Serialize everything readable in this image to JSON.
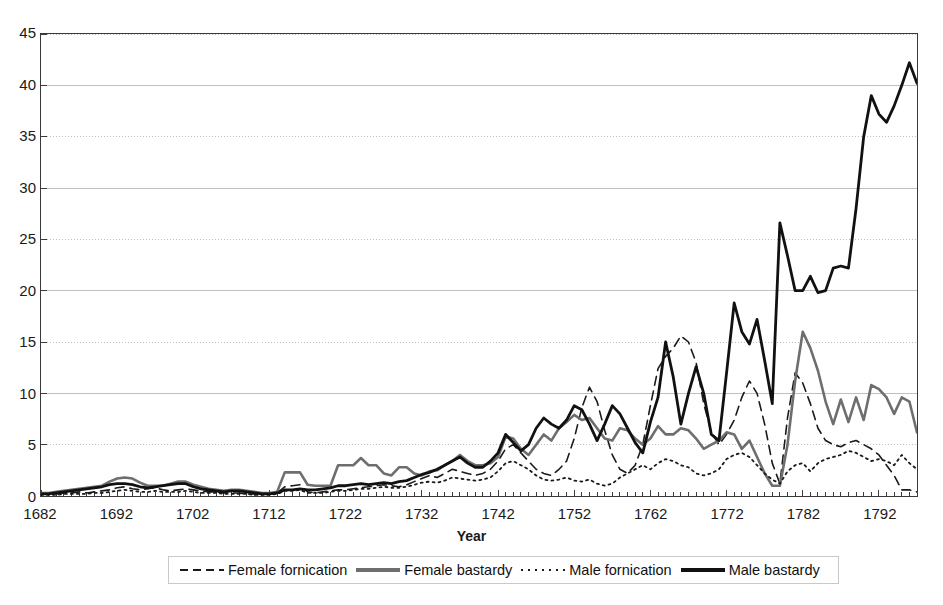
{
  "chart_data": {
    "type": "line",
    "title": "",
    "xlabel": "Year",
    "ylabel": "",
    "xlim": [
      1682,
      1797
    ],
    "ylim": [
      0,
      45
    ],
    "grid": true,
    "legend_position": "bottom",
    "y_ticks": [
      0,
      5,
      10,
      15,
      20,
      25,
      30,
      35,
      40,
      45
    ],
    "x_ticks": [
      1682,
      1692,
      1702,
      1712,
      1722,
      1732,
      1742,
      1752,
      1762,
      1772,
      1782,
      1792
    ],
    "x": [
      1682,
      1683,
      1684,
      1685,
      1686,
      1687,
      1688,
      1689,
      1690,
      1691,
      1692,
      1693,
      1694,
      1695,
      1696,
      1697,
      1698,
      1699,
      1700,
      1701,
      1702,
      1703,
      1704,
      1705,
      1706,
      1707,
      1708,
      1709,
      1710,
      1711,
      1712,
      1713,
      1714,
      1715,
      1716,
      1717,
      1718,
      1719,
      1720,
      1721,
      1722,
      1723,
      1724,
      1725,
      1726,
      1727,
      1728,
      1729,
      1730,
      1731,
      1732,
      1733,
      1734,
      1735,
      1736,
      1737,
      1738,
      1739,
      1740,
      1741,
      1742,
      1743,
      1744,
      1745,
      1746,
      1747,
      1748,
      1749,
      1750,
      1751,
      1752,
      1753,
      1754,
      1755,
      1756,
      1757,
      1758,
      1759,
      1760,
      1761,
      1762,
      1763,
      1764,
      1765,
      1766,
      1767,
      1768,
      1769,
      1770,
      1771,
      1772,
      1773,
      1774,
      1775,
      1776,
      1777,
      1778,
      1779,
      1780,
      1781,
      1782,
      1783,
      1784,
      1785,
      1786,
      1787,
      1788,
      1789,
      1790,
      1791,
      1792,
      1793,
      1794,
      1795,
      1796,
      1797
    ],
    "series": [
      {
        "name": "Female fornication",
        "style": "dashed",
        "color": "#1a1a1a",
        "width": 1.6,
        "values": [
          0.2,
          0.2,
          0.2,
          0.3,
          0.3,
          0.4,
          0.3,
          0.4,
          0.5,
          0.6,
          0.8,
          0.9,
          0.7,
          0.6,
          0.7,
          0.8,
          0.6,
          0.5,
          0.6,
          0.7,
          0.6,
          0.5,
          0.4,
          0.4,
          0.3,
          0.3,
          0.3,
          0.2,
          0.2,
          0.2,
          0.2,
          0.3,
          0.9,
          1.0,
          1.1,
          0.4,
          0.3,
          0.4,
          0.5,
          0.6,
          0.6,
          0.7,
          0.8,
          0.9,
          1.0,
          1.1,
          1.0,
          0.9,
          1.1,
          1.4,
          1.7,
          2.0,
          1.8,
          2.2,
          2.6,
          2.4,
          2.2,
          2.0,
          2.2,
          2.6,
          3.4,
          4.6,
          5.0,
          4.2,
          3.4,
          2.6,
          2.2,
          2.0,
          2.6,
          3.4,
          5.6,
          8.6,
          10.6,
          9.2,
          6.4,
          4.0,
          2.6,
          2.2,
          3.0,
          5.0,
          8.8,
          12.4,
          13.6,
          14.4,
          15.6,
          15.0,
          13.0,
          9.0,
          6.2,
          5.0,
          6.0,
          7.4,
          9.6,
          11.2,
          10.0,
          7.0,
          3.2,
          1.2,
          7.6,
          12.0,
          11.0,
          9.0,
          6.6,
          5.4,
          5.0,
          4.8,
          5.2,
          5.4,
          5.0,
          4.6,
          4.0,
          3.0,
          2.0,
          0.6,
          0.6,
          0.4
        ]
      },
      {
        "name": "Female bastardy",
        "style": "solid",
        "color": "#6e6e6e",
        "width": 2.6,
        "values": [
          0.3,
          0.3,
          0.4,
          0.5,
          0.6,
          0.7,
          0.8,
          0.9,
          1.0,
          1.4,
          1.7,
          1.8,
          1.7,
          1.3,
          1.0,
          1.0,
          1.0,
          1.2,
          1.4,
          1.4,
          1.1,
          0.9,
          0.7,
          0.6,
          0.5,
          0.6,
          0.6,
          0.5,
          0.4,
          0.3,
          0.3,
          0.4,
          2.3,
          2.3,
          2.3,
          1.1,
          1.0,
          1.0,
          1.0,
          3.0,
          3.0,
          3.0,
          3.7,
          3.0,
          3.0,
          2.2,
          2.0,
          2.8,
          2.8,
          2.2,
          2.0,
          2.4,
          2.5,
          3.0,
          3.4,
          4.0,
          3.4,
          3.0,
          3.0,
          3.2,
          3.8,
          5.8,
          5.6,
          4.6,
          4.0,
          5.0,
          6.0,
          5.4,
          6.6,
          7.2,
          7.9,
          7.4,
          7.6,
          6.6,
          5.6,
          5.4,
          6.6,
          6.4,
          5.6,
          5.0,
          5.6,
          6.8,
          6.0,
          6.0,
          6.6,
          6.4,
          5.6,
          4.6,
          5.0,
          5.4,
          6.2,
          6.0,
          4.6,
          5.4,
          3.8,
          2.2,
          1.0,
          1.0,
          5.0,
          11.2,
          16.0,
          14.4,
          12.2,
          9.2,
          7.0,
          9.4,
          7.2,
          9.6,
          7.4,
          10.8,
          10.4,
          9.6,
          8.0,
          9.6,
          9.2,
          6.2
        ]
      },
      {
        "name": "Male fornication",
        "style": "dotted",
        "color": "#1a1a1a",
        "width": 1.8,
        "values": [
          0.1,
          0.1,
          0.1,
          0.2,
          0.2,
          0.2,
          0.2,
          0.3,
          0.3,
          0.4,
          0.5,
          0.6,
          0.5,
          0.4,
          0.4,
          0.5,
          0.4,
          0.4,
          0.4,
          0.5,
          0.4,
          0.3,
          0.3,
          0.3,
          0.2,
          0.2,
          0.2,
          0.2,
          0.1,
          0.1,
          0.1,
          0.2,
          0.5,
          0.5,
          0.6,
          0.3,
          0.3,
          0.3,
          0.4,
          0.5,
          0.5,
          0.6,
          0.7,
          0.7,
          0.8,
          0.9,
          0.8,
          0.8,
          0.9,
          1.1,
          1.3,
          1.4,
          1.3,
          1.5,
          1.8,
          1.7,
          1.6,
          1.5,
          1.6,
          1.8,
          2.4,
          3.2,
          3.4,
          3.0,
          2.6,
          2.0,
          1.6,
          1.5,
          1.6,
          1.8,
          1.5,
          1.4,
          1.6,
          1.2,
          1.0,
          1.2,
          1.8,
          2.2,
          2.6,
          3.0,
          2.6,
          3.2,
          3.6,
          3.4,
          3.0,
          2.8,
          2.2,
          2.0,
          2.2,
          2.6,
          3.6,
          4.0,
          4.2,
          3.8,
          3.0,
          2.2,
          1.6,
          1.2,
          2.4,
          3.0,
          3.2,
          2.4,
          3.2,
          3.6,
          3.8,
          4.0,
          4.4,
          4.2,
          3.8,
          3.4,
          3.6,
          3.4,
          3.0,
          4.0,
          3.2,
          2.6
        ]
      },
      {
        "name": "Male bastardy",
        "style": "solid",
        "color": "#111111",
        "width": 2.8,
        "values": [
          0.2,
          0.2,
          0.3,
          0.4,
          0.5,
          0.6,
          0.7,
          0.8,
          0.9,
          1.1,
          1.2,
          1.2,
          1.1,
          0.9,
          0.8,
          0.9,
          1.0,
          1.1,
          1.2,
          1.2,
          0.9,
          0.7,
          0.6,
          0.5,
          0.4,
          0.5,
          0.5,
          0.4,
          0.3,
          0.2,
          0.2,
          0.3,
          0.6,
          0.6,
          0.7,
          0.6,
          0.6,
          0.7,
          0.8,
          1.0,
          1.0,
          1.1,
          1.2,
          1.1,
          1.2,
          1.3,
          1.2,
          1.4,
          1.5,
          1.8,
          2.1,
          2.3,
          2.6,
          3.0,
          3.4,
          3.8,
          3.2,
          2.8,
          2.8,
          3.4,
          4.2,
          6.0,
          5.2,
          4.4,
          5.0,
          6.6,
          7.6,
          7.0,
          6.6,
          7.4,
          8.8,
          8.4,
          7.0,
          5.4,
          7.0,
          8.8,
          8.0,
          6.6,
          5.2,
          4.2,
          7.2,
          9.6,
          15.0,
          11.6,
          7.0,
          10.0,
          12.6,
          10.0,
          6.0,
          5.4,
          12.0,
          18.8,
          16.0,
          14.8,
          17.2,
          13.2,
          9.0,
          26.6,
          23.4,
          20.0,
          20.0,
          21.4,
          19.8,
          20.0,
          22.2,
          22.4,
          22.2,
          28.0,
          35.0,
          39.0,
          37.2,
          36.4,
          38.0,
          40.0,
          42.2,
          40.2
        ]
      }
    ]
  },
  "legend": {
    "items": [
      {
        "label": "Female fornication",
        "style": "dashed",
        "color": "#1a1a1a"
      },
      {
        "label": "Female bastardy",
        "style": "solid-gray",
        "color": "#6e6e6e"
      },
      {
        "label": "Male fornication",
        "style": "dotted",
        "color": "#1a1a1a"
      },
      {
        "label": "Male bastardy",
        "style": "solid-black",
        "color": "#111111"
      }
    ]
  },
  "axis": {
    "x_title": "Year"
  },
  "colors": {
    "frame": "#3a3a3a",
    "gridline": "#bfbfbf",
    "background": "#ffffff"
  }
}
